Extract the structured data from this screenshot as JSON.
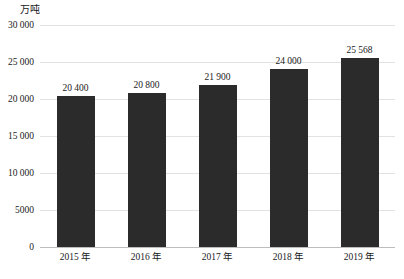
{
  "chart_data": {
    "type": "bar",
    "title": "",
    "subtitle": "",
    "unit_label": "万吨",
    "xlabel": "",
    "ylabel": "",
    "ylim": [
      0,
      30000
    ],
    "grid": true,
    "legend": "none",
    "categories": [
      "2015 年",
      "2016 年",
      "2017 年",
      "2018 年",
      "2019 年"
    ],
    "values": [
      20400,
      20800,
      21900,
      24000,
      25568
    ],
    "value_labels": [
      "20 400",
      "20 800",
      "21 900",
      "24 000",
      "25 568"
    ],
    "yticks": [
      0,
      5000,
      10000,
      15000,
      20000,
      25000,
      30000
    ],
    "ytick_labels": [
      "0",
      "5000",
      "10 000",
      "15 000",
      "20 000",
      "25 000",
      "30 000"
    ],
    "colors": {
      "bar": "#2b2b2b",
      "gridline": "#e2e2e2",
      "axis": "#bdbdbd",
      "background": "#ffffff",
      "text": "#1a1a1a"
    }
  }
}
